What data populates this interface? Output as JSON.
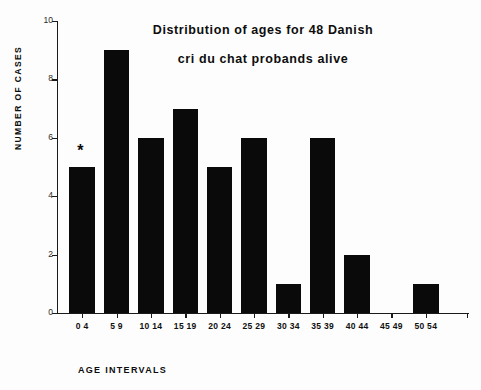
{
  "chart_data": {
    "type": "bar",
    "title": "Distribution of ages for 48 Danish cri du chat probands alive",
    "title_lines": [
      "Distribution of ages for 48 Danish",
      "cri du chat probands alive"
    ],
    "categories": [
      "0  4",
      "5  9",
      "10 14",
      "15 19",
      "20 24",
      "25 29",
      "30 34",
      "35 39",
      "40 44",
      "45 49",
      "50 54"
    ],
    "values": [
      5,
      9,
      6,
      7,
      5,
      6,
      1,
      6,
      2,
      0,
      1
    ],
    "xlabel": "AGE  INTERVALS",
    "ylabel": "NUMBER  OF  CASES",
    "ylim": [
      0,
      10
    ],
    "ytick_labels": [
      "0",
      "2",
      "4",
      "6",
      "8",
      "10"
    ],
    "ytick_values": [
      0,
      2,
      4,
      6,
      8,
      10
    ],
    "grid": false,
    "legend": "none",
    "bar_color": "#0a0a0a",
    "background_color": "#fdfdfd",
    "annotations": [
      {
        "text": "*",
        "category": "0  4",
        "value": 5
      }
    ]
  }
}
